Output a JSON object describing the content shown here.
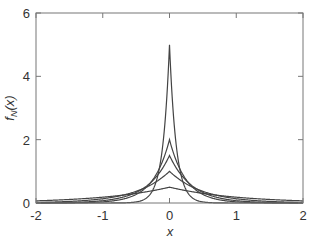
{
  "chart_data": {
    "type": "line",
    "title": "",
    "xlabel": "x",
    "ylabel": "f_N(x)",
    "ylabel_parts": {
      "f": "f",
      "sub": "N",
      "arg": "(x)"
    },
    "xlim": [
      -2,
      2
    ],
    "ylim": [
      0,
      6
    ],
    "xticks": [
      -2,
      -1,
      0,
      1,
      2
    ],
    "yticks": [
      0,
      2,
      4,
      6
    ],
    "xtick_labels": [
      "-2",
      "-1",
      "0",
      "1",
      "2"
    ],
    "ytick_labels": [
      "0",
      "2",
      "4",
      "6"
    ],
    "grid": false,
    "legend": null,
    "formula": "f_N(x) = (N/2) * exp(-N*|x|)",
    "series": [
      {
        "name": "N=1",
        "N": 1,
        "peak": 0.5
      },
      {
        "name": "N=2",
        "N": 2,
        "peak": 1.0
      },
      {
        "name": "N=3",
        "N": 3,
        "peak": 1.5
      },
      {
        "name": "N=4",
        "N": 4,
        "peak": 2.0
      },
      {
        "name": "N=10",
        "N": 10,
        "peak": 5.0
      }
    ],
    "sample_points": {
      "x": [
        -2,
        -1,
        -0.5,
        0,
        0.5,
        1,
        2
      ],
      "N=1": [
        0.068,
        0.184,
        0.303,
        0.5,
        0.303,
        0.184,
        0.068
      ],
      "N=2": [
        0.018,
        0.135,
        0.368,
        1.0,
        0.368,
        0.135,
        0.018
      ],
      "N=3": [
        0.004,
        0.075,
        0.335,
        1.5,
        0.335,
        0.075,
        0.004
      ],
      "N=4": [
        0.001,
        0.037,
        0.271,
        2.0,
        0.271,
        0.037,
        0.001
      ],
      "N=10": [
        0.0,
        0.0,
        0.034,
        5.0,
        0.034,
        0.0,
        0.0
      ]
    },
    "colors": {
      "line": "#444444",
      "axis": "#777777",
      "text": "#333333"
    }
  }
}
